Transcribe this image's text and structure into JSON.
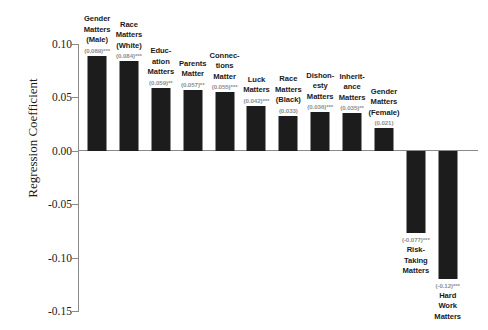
{
  "chart_data": {
    "type": "bar",
    "title": "",
    "subtitle": "",
    "xlabel": "",
    "ylabel": "Regression Coefficient",
    "ylim": [
      -0.15,
      0.1
    ],
    "grid": false,
    "legend": null,
    "bar_color": "#1c1c1c",
    "axis_color": "#8a8a8a",
    "value_label_color": "#8f8f8f",
    "yticks": [
      "0.10",
      "0.05",
      "0.00",
      "-0.05",
      "-0.10",
      "-0.15"
    ],
    "ytick_values": [
      0.1,
      0.05,
      0.0,
      -0.05,
      -0.1,
      -0.15
    ],
    "categories": [
      "Gender Matters (Male)",
      "Race Matters (White)",
      "Education Matters",
      "Parents Matter",
      "Connections Matter",
      "Luck Matters",
      "Race Matters (Black)",
      "Dishonesty Matters",
      "Inheritance Matters",
      "Gender Matters (Female)",
      "Risk-Taking Matters",
      "Hard Work Matters"
    ],
    "values": [
      0.089,
      0.084,
      0.059,
      0.057,
      0.055,
      0.042,
      0.033,
      0.036,
      0.035,
      0.021,
      -0.077,
      -0.12
    ],
    "bars": [
      {
        "category": "Gender Matters (Male)",
        "label_lines": [
          "Gender",
          "Matters",
          "(Male)"
        ],
        "value": 0.089,
        "value_label": "(0.089)***",
        "significance": "***"
      },
      {
        "category": "Race Matters (White)",
        "label_lines": [
          "Race",
          "Matters",
          "(White)"
        ],
        "value": 0.084,
        "value_label": "(0.084)***",
        "significance": "***"
      },
      {
        "category": "Education Matters",
        "label_lines": [
          "Educ-",
          "ation",
          "Matters"
        ],
        "value": 0.059,
        "value_label": "(0.059)**",
        "significance": "**"
      },
      {
        "category": "Parents Matter",
        "label_lines": [
          "Parents",
          "Matter"
        ],
        "value": 0.057,
        "value_label": "(0.057)**",
        "significance": "**"
      },
      {
        "category": "Connections Matter",
        "label_lines": [
          "Connec-",
          "tions",
          "Matter"
        ],
        "value": 0.055,
        "value_label": "(0.055)***",
        "significance": "***"
      },
      {
        "category": "Luck Matters",
        "label_lines": [
          "Luck",
          "Matters"
        ],
        "value": 0.042,
        "value_label": "(0.042)***",
        "significance": "***"
      },
      {
        "category": "Race Matters (Black)",
        "label_lines": [
          "Race",
          "Matters",
          "(Black)"
        ],
        "value": 0.033,
        "value_label": "(0.033)",
        "significance": ""
      },
      {
        "category": "Dishonesty Matters",
        "label_lines": [
          "Dishon-",
          "esty",
          "Matters"
        ],
        "value": 0.036,
        "value_label": "(0.036)***",
        "significance": "***"
      },
      {
        "category": "Inheritance Matters",
        "label_lines": [
          "Inherit-",
          "ance",
          "Matters"
        ],
        "value": 0.035,
        "value_label": "(0.035)**",
        "significance": "**"
      },
      {
        "category": "Gender Matters (Female)",
        "label_lines": [
          "Gender",
          "Matters",
          "(Female)"
        ],
        "value": 0.021,
        "value_label": "(0.021)",
        "significance": ""
      },
      {
        "category": "Risk-Taking Matters",
        "label_lines": [
          "Risk-",
          "Taking",
          "Matters"
        ],
        "value": -0.077,
        "value_label": "(-0.077)***",
        "significance": "***"
      },
      {
        "category": "Hard Work Matters",
        "label_lines": [
          "Hard",
          "Work",
          "Matters"
        ],
        "value": -0.12,
        "value_label": "(-0.12)***",
        "significance": "***"
      }
    ]
  }
}
